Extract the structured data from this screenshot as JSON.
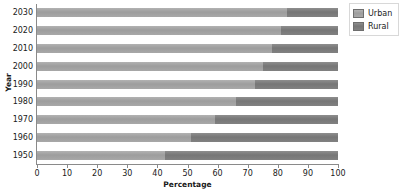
{
  "chart_data": {
    "type": "bar",
    "orientation": "horizontal",
    "stacked": true,
    "stack_mode": "percent",
    "title": "",
    "xlabel": "Percentage",
    "ylabel": "Year",
    "xlim": [
      0,
      100
    ],
    "xticks": [
      0,
      10,
      20,
      30,
      40,
      50,
      60,
      70,
      80,
      90,
      100
    ],
    "xtick_labels": [
      "0",
      "10",
      "20",
      "30",
      "40",
      "50",
      "60",
      "70",
      "80",
      "90",
      "100"
    ],
    "grid": false,
    "legend_position": "top-right",
    "categories": [
      "1950",
      "1960",
      "1970",
      "1980",
      "1990",
      "2000",
      "2010",
      "2020",
      "2030"
    ],
    "category_order_top_to_bottom": [
      "2030",
      "2020",
      "2010",
      "2000",
      "1990",
      "1980",
      "1970",
      "1960",
      "1950"
    ],
    "series": [
      {
        "name": "Urban",
        "color": "#a3a3a3",
        "values": [
          42.5,
          51.0,
          59.0,
          66.0,
          72.5,
          75.0,
          78.0,
          81.0,
          83.0
        ]
      },
      {
        "name": "Rural",
        "color": "#7d7d7d",
        "values": [
          57.5,
          49.0,
          41.0,
          34.0,
          27.5,
          25.0,
          22.0,
          19.0,
          17.0
        ]
      }
    ]
  },
  "legend": {
    "items": [
      {
        "label": "Urban",
        "swatch": "urban"
      },
      {
        "label": "Rural",
        "swatch": "rural"
      }
    ]
  },
  "colors": {
    "urban": "#a3a3a3",
    "rural": "#7d7d7d",
    "axis": "#8a8a8a",
    "text": "#1a1a1a",
    "background": "#ffffff"
  }
}
